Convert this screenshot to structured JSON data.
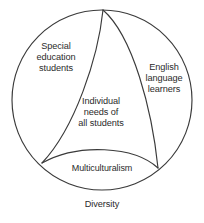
{
  "diagram": {
    "title": "Diversity",
    "type": "venn-circle-partition",
    "caption": "Diversity",
    "background_color": "#ffffff",
    "stroke_color": "#3a3a3a",
    "text_color": "#2b2b2b",
    "circle": {
      "center_x": 102,
      "center_y": 100,
      "radius": 90
    },
    "regions": [
      {
        "id": "special-education-students",
        "label": "Special\neducation\nstudents",
        "position": "top-left"
      },
      {
        "id": "english-language-learners",
        "label": "English\nlanguage\nlearners",
        "position": "right"
      },
      {
        "id": "individual-needs-of-all-students",
        "label": "Individual\nneeds of\nall students",
        "position": "center"
      },
      {
        "id": "multiculturalism",
        "label": "Multiculturalism",
        "position": "bottom"
      }
    ]
  }
}
